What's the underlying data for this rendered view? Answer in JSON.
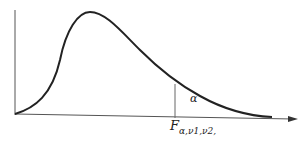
{
  "diagram": {
    "labels": {
      "area": "α",
      "critical_value_main": "F",
      "critical_value_subscript": "α,ν1,ν2,"
    },
    "colors": {
      "curve": "#222222",
      "axes": "#555555",
      "background": "#ffffff"
    }
  }
}
